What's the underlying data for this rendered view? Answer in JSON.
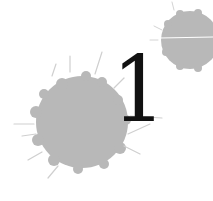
{
  "chapter": {
    "number": "1"
  },
  "colors": {
    "background": "#ffffff",
    "splatter": "#b8b8b8",
    "numeral": "#111111"
  },
  "graphics": {
    "large_splatter": {
      "cx": 82,
      "cy": 122,
      "r": 47
    },
    "small_splatter": {
      "cx": 190,
      "cy": 40,
      "r": 29
    }
  }
}
